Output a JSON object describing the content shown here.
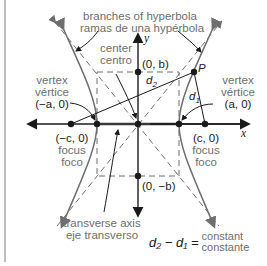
{
  "diagram": {
    "title_lines": [
      "branches of hyperbola",
      "ramas de una hypérbola"
    ],
    "center_label": [
      "center",
      "centro"
    ],
    "vertex_left": {
      "label": [
        "vertex",
        "vértice"
      ],
      "coord": "(−a, 0)"
    },
    "vertex_right": {
      "label": [
        "vertex",
        "vértice"
      ],
      "coord": "(a, 0)"
    },
    "focus_left": {
      "coord": "(−c, 0)",
      "label": [
        "focus",
        "foco"
      ]
    },
    "focus_right": {
      "coord": "(c, 0)",
      "label": [
        "focus",
        "foco"
      ]
    },
    "point_b_top": "(0, b)",
    "point_b_bottom": "(0, −b)",
    "point_p": "P",
    "d1": "d",
    "d1_sub": "1",
    "d2": "d",
    "d2_sub": "2",
    "axis_x": "x",
    "axis_y": "y",
    "transverse_axis": [
      "transverse axis",
      "eje transverso"
    ],
    "equation": {
      "lhs": "d₂ − d₁ =",
      "rhs": [
        "constant",
        "constante"
      ]
    },
    "colors": {
      "curve": "#6e6e6e",
      "axis": "#1a1a1a",
      "dashed": "#6e6e6e",
      "transverse_axis": "#9a9a9a",
      "label_gray": "#6e6e6e"
    }
  }
}
